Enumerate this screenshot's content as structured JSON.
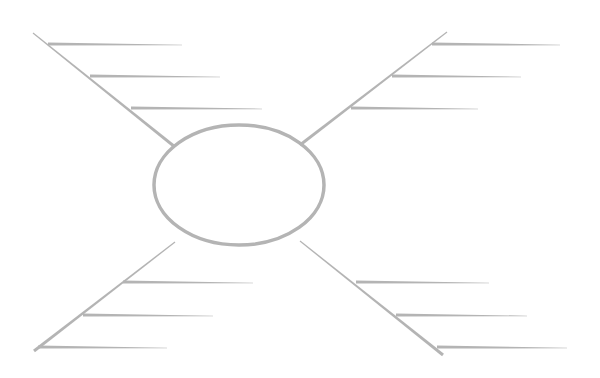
{
  "diagram": {
    "type": "spider-diagram-template",
    "stroke_color": "#b4b4b4",
    "background": "#ffffff",
    "center": {
      "cx": 239,
      "cy": 185,
      "rx": 85,
      "ry": 60
    },
    "legs": [
      {
        "name": "top-left",
        "spine": [
          [
            33,
            33
          ],
          [
            175,
            147
          ]
        ],
        "branches": [
          [
            [
              48,
              44
            ],
            [
              182,
              45
            ]
          ],
          [
            [
              90,
              76
            ],
            [
              220,
              77
            ]
          ],
          [
            [
              131,
              108
            ],
            [
              262,
              109
            ]
          ]
        ]
      },
      {
        "name": "top-right",
        "spine": [
          [
            447,
            32
          ],
          [
            300,
            145
          ]
        ],
        "branches": [
          [
            [
              432,
              44
            ],
            [
              560,
              45
            ]
          ],
          [
            [
              392,
              76
            ],
            [
              521,
              77
            ]
          ],
          [
            [
              351,
              108
            ],
            [
              478,
              109
            ]
          ]
        ]
      },
      {
        "name": "bottom-left",
        "spine": [
          [
            175,
            242
          ],
          [
            34,
            351
          ]
        ],
        "branches": [
          [
            [
              123,
              282
            ],
            [
              253,
              283
            ]
          ],
          [
            [
              83,
              315
            ],
            [
              213,
              316
            ]
          ],
          [
            [
              38,
              347
            ],
            [
              167,
              348
            ]
          ]
        ]
      },
      {
        "name": "bottom-right",
        "spine": [
          [
            300,
            241
          ],
          [
            443,
            355
          ]
        ],
        "branches": [
          [
            [
              356,
              282
            ],
            [
              489,
              283
            ]
          ],
          [
            [
              396,
              315
            ],
            [
              527,
              316
            ]
          ],
          [
            [
              437,
              347
            ],
            [
              567,
              348
            ]
          ]
        ]
      }
    ]
  }
}
